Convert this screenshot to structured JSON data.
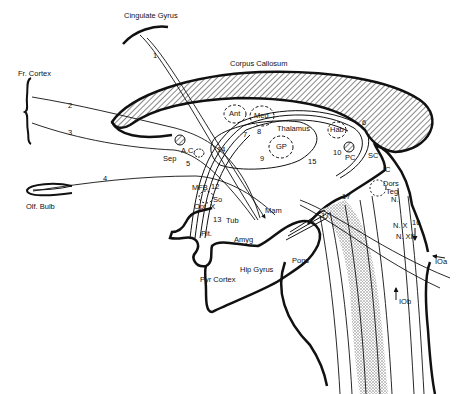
{
  "diagram": {
    "type": "neuroanatomy-sagittal-pathways",
    "colors": {
      "ink": "#111111",
      "paper": "#ffffff",
      "stipple": "#bdbdbd"
    },
    "regions": {
      "cingulate_gyrus": "Cingulate Gyrus",
      "corpus_callosum": "Corpus Callosum",
      "fr_cortex": "Fr. Cortex",
      "olf_bulb": "Olf. Bulb",
      "ac": "A.C.",
      "sep": "Sep",
      "mfb": "MFB",
      "opt_x": "Opt. X",
      "so": "So",
      "pit": "Pit.",
      "tub": "Tub",
      "mam": "Mam",
      "amyg": "Amyg",
      "hip_gyrus": "Hip Gyrus",
      "pyr_cortex": "Pyr Cortex",
      "pons": "Pons",
      "ant": "Ant",
      "med": "Med.",
      "thalamus": "Thalamus",
      "gp": "GP",
      "hab": "Hab",
      "pc": "PC",
      "sc": "SC",
      "ic": "IC",
      "dors_teg_n": [
        "Dors",
        "Teg",
        "N."
      ],
      "n_x": "N. X",
      "n_xii": "N. XII",
      "ioa": "IOa",
      "iob": "IOb"
    },
    "pathway_numbers": [
      "1",
      "2",
      "3",
      "4",
      "5",
      "6",
      "7",
      "8",
      "9",
      "10",
      "12",
      "13",
      "14",
      "15",
      "16",
      "17",
      "17'"
    ]
  }
}
